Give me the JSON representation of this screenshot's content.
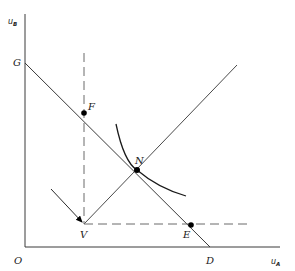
{
  "diagram": {
    "axes": {
      "y_label": "u",
      "y_label_sub": "B",
      "x_label": "u",
      "x_label_sub": "A",
      "origin_label": "O"
    },
    "points": {
      "G": "G",
      "F": "F",
      "N": "N",
      "V": "V",
      "E": "E",
      "D": "D"
    },
    "colors": {
      "line": "#3a3a3a",
      "dashed": "#6a6a6a",
      "point": "#000000"
    }
  }
}
